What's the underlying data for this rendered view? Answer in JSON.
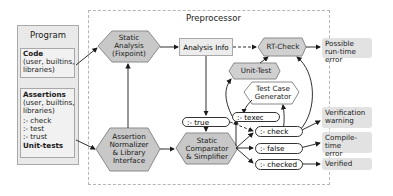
{
  "diagram": {
    "program": {
      "title": "Program",
      "code": {
        "title": "Code",
        "detail_line1": "(user, builtins,",
        "detail_line2": "libraries)"
      },
      "assertions": {
        "title": "Assertions",
        "detail_line1": "(user, builtins,",
        "detail_line2": "libraries)",
        "items": [
          ":- check",
          ":- test",
          ":- trust"
        ],
        "footer": "Unit-tests"
      }
    },
    "preprocessor": {
      "title": "Preprocessor",
      "static_analysis": {
        "line1": "Static",
        "line2": "Analysis",
        "line3": "(Fixpoint)"
      },
      "analysis_info": "Analysis Info",
      "rt_check": "RT-Check",
      "unit_test": "Unit-Test",
      "test_case_generator": {
        "line1": "Test Case",
        "line2": "Generator"
      },
      "assertion_normalizer": {
        "line1": "Assertion",
        "line2": "Normalizer",
        "line3": "& Library",
        "line4": "Interface"
      },
      "static_comparator": {
        "line1": "Static",
        "line2": "Comparator",
        "line3": "& Simplifier"
      },
      "pills": {
        "true": ":- true",
        "texec": ":- texec",
        "check": ":- check",
        "false": ":- false",
        "checked": ":- checked"
      }
    },
    "outputs": {
      "runtime_error": {
        "line1": "Possible",
        "line2": "run-time error"
      },
      "verification_warning": {
        "line1": "Verification",
        "line2": "warning"
      },
      "compile_time_error": {
        "line1": "Compile-time",
        "line2": "error"
      },
      "verified": "Verified"
    },
    "colors": {
      "node_fill": "#c8c8c8",
      "box_fill": "#e9e9e9",
      "result_fill": "#e2e2e2",
      "border": "#a8a8a8",
      "arrow": "#1a1a1a"
    }
  }
}
